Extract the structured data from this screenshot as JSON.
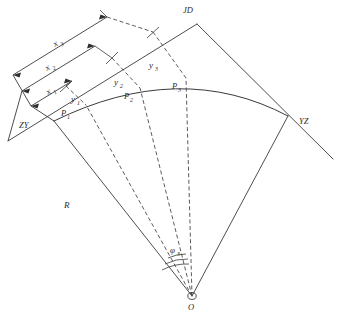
{
  "figure": {
    "type": "engineering-survey-diagram",
    "background_color": "#ffffff",
    "line_color": "#3a3a3a",
    "text_color": "#2b2b2b"
  },
  "control_points": {
    "zy": {
      "label": "ZY",
      "meaning": "beginning of curve (straight-to-curve point)",
      "x": 30,
      "y": 119
    },
    "jd": {
      "label": "JD",
      "meaning": "intersection point of the two tangents",
      "x": 190,
      "y": 13
    },
    "yz": {
      "label": "YZ",
      "meaning": "end of curve (curve-to-straight point)",
      "x": 303,
      "y": 121
    },
    "o": {
      "label": "O",
      "meaning": "centre of the circular curve",
      "x": 192,
      "y": 296
    }
  },
  "curve_points": [
    {
      "label": "P",
      "subscript": "1",
      "x": 66,
      "y": 110
    },
    {
      "label": "P",
      "subscript": "2",
      "x": 129,
      "y": 94
    },
    {
      "label": "P",
      "subscript": "3",
      "x": 175,
      "y": 84
    }
  ],
  "offset_labels": [
    {
      "label": "y",
      "subscript": "1",
      "x": 74,
      "y": 98
    },
    {
      "label": "y",
      "subscript": "2",
      "x": 117,
      "y": 81
    },
    {
      "label": "y",
      "subscript": "3",
      "x": 152,
      "y": 65
    }
  ],
  "abscissa_labels": [
    {
      "label": "x",
      "subscript": "1",
      "x": 51,
      "y": 93
    },
    {
      "label": "x",
      "subscript": "2",
      "x": 50,
      "y": 68
    },
    {
      "label": "x",
      "subscript": "3",
      "x": 59,
      "y": 44
    }
  ],
  "radius_label": {
    "label": "R",
    "x": 67,
    "y": 205
  },
  "angle_label": {
    "label": "φ",
    "subscript": "3",
    "x": 174,
    "y": 250
  },
  "notes": {
    "tangent_back": "tangent line through ZY extended beyond JD",
    "tangent_forward": "tangent line through YZ",
    "radii": "dashed radius lines drawn from O to P1, P2, P3 and to YZ"
  }
}
